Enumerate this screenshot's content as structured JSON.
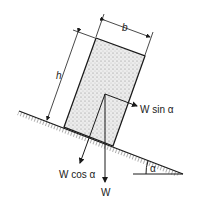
{
  "diagram": {
    "labels": {
      "width": "b",
      "height": "h",
      "weight": "W",
      "normal_component": "W cos α",
      "parallel_component": "W sin α",
      "angle": "α"
    },
    "colors": {
      "ink": "#1a1a1a",
      "fill": "#e6e6e6",
      "background": "#ffffff"
    }
  }
}
